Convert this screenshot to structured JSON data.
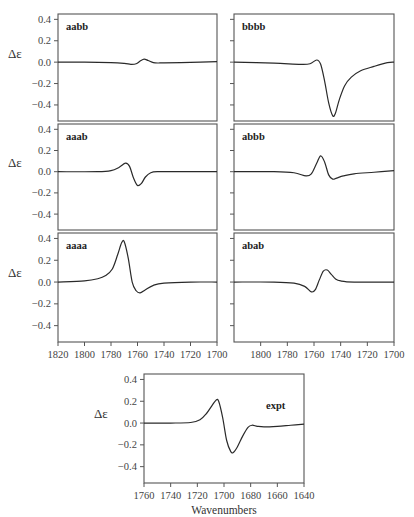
{
  "chart_data": [
    {
      "type": "line",
      "panel": "aabb",
      "title": "aabb",
      "xlabel": "",
      "ylabel": "Δε",
      "xlim": [
        1820,
        1700
      ],
      "ylim": [
        -0.55,
        0.45
      ],
      "yticks": [
        0.4,
        0.2,
        0.0,
        -0.2,
        -0.4
      ],
      "x": [
        1820,
        1800,
        1780,
        1770,
        1765,
        1761,
        1758,
        1755,
        1752,
        1748,
        1744,
        1740,
        1720,
        1700
      ],
      "y": [
        0.0,
        0.0,
        -0.005,
        -0.012,
        -0.02,
        -0.015,
        0.01,
        0.028,
        0.015,
        -0.005,
        -0.008,
        -0.006,
        -0.002,
        0.005
      ]
    },
    {
      "type": "line",
      "panel": "bbbb",
      "title": "bbbb",
      "xlabel": "",
      "ylabel": "",
      "xlim": [
        1820,
        1700
      ],
      "ylim": [
        -0.55,
        0.45
      ],
      "yticks": [
        0.4,
        0.2,
        0.0,
        -0.2,
        -0.4
      ],
      "x": [
        1820,
        1790,
        1770,
        1763,
        1758,
        1755,
        1752,
        1749,
        1746,
        1744,
        1741,
        1737,
        1732,
        1725,
        1715,
        1705,
        1700
      ],
      "y": [
        0.0,
        -0.01,
        -0.02,
        -0.015,
        0.02,
        -0.02,
        -0.18,
        -0.38,
        -0.5,
        -0.48,
        -0.35,
        -0.22,
        -0.14,
        -0.08,
        -0.04,
        -0.005,
        0.0
      ]
    },
    {
      "type": "line",
      "panel": "aaab",
      "title": "aaab",
      "xlabel": "",
      "ylabel": "Δε",
      "xlim": [
        1820,
        1700
      ],
      "ylim": [
        -0.55,
        0.45
      ],
      "yticks": [
        0.4,
        0.2,
        0.0,
        -0.2,
        -0.4
      ],
      "x": [
        1820,
        1790,
        1780,
        1774,
        1769,
        1766,
        1763,
        1760,
        1757,
        1754,
        1750,
        1745,
        1730,
        1700
      ],
      "y": [
        0.0,
        0.0,
        0.01,
        0.04,
        0.08,
        0.05,
        -0.06,
        -0.13,
        -0.11,
        -0.05,
        -0.01,
        0.0,
        0.0,
        0.0
      ]
    },
    {
      "type": "line",
      "panel": "abbb",
      "title": "abbb",
      "xlabel": "",
      "ylabel": "",
      "xlim": [
        1820,
        1700
      ],
      "ylim": [
        -0.55,
        0.45
      ],
      "yticks": [
        0.4,
        0.2,
        0.0,
        -0.2,
        -0.4
      ],
      "x": [
        1820,
        1790,
        1775,
        1766,
        1762,
        1758,
        1755,
        1752,
        1749,
        1746,
        1743,
        1738,
        1730,
        1715,
        1700
      ],
      "y": [
        0.0,
        0.0,
        -0.01,
        -0.04,
        -0.02,
        0.08,
        0.15,
        0.09,
        -0.03,
        -0.07,
        -0.06,
        -0.04,
        -0.02,
        -0.005,
        0.01
      ]
    },
    {
      "type": "line",
      "panel": "aaaa",
      "title": "aaaa",
      "xlabel": "",
      "ylabel": "Δε",
      "xlim": [
        1820,
        1700
      ],
      "ylim": [
        -0.55,
        0.45
      ],
      "yticks": [
        0.4,
        0.2,
        0.0,
        -0.2,
        -0.4
      ],
      "xticks": [
        1820,
        1800,
        1780,
        1760,
        1740,
        1720,
        1700
      ],
      "x": [
        1820,
        1800,
        1790,
        1784,
        1779,
        1775,
        1772,
        1770,
        1767,
        1764,
        1761,
        1758,
        1754,
        1748,
        1740,
        1720,
        1700
      ],
      "y": [
        0.0,
        0.01,
        0.03,
        0.06,
        0.12,
        0.25,
        0.36,
        0.37,
        0.22,
        0.0,
        -0.08,
        -0.1,
        -0.07,
        -0.03,
        -0.01,
        0.0,
        0.0
      ]
    },
    {
      "type": "line",
      "panel": "abab",
      "title": "abab",
      "xlabel": "",
      "ylabel": "",
      "xlim": [
        1820,
        1700
      ],
      "ylim": [
        -0.55,
        0.45
      ],
      "yticks": [
        0.4,
        0.2,
        0.0,
        -0.2,
        -0.4
      ],
      "xticks": [
        1800,
        1780,
        1760,
        1740,
        1720,
        1700
      ],
      "x": [
        1820,
        1790,
        1775,
        1767,
        1762,
        1759,
        1756,
        1753,
        1750,
        1747,
        1744,
        1740,
        1730,
        1700
      ],
      "y": [
        0.0,
        0.0,
        -0.01,
        -0.04,
        -0.09,
        -0.07,
        0.02,
        0.1,
        0.11,
        0.07,
        0.03,
        0.01,
        0.0,
        0.0
      ]
    },
    {
      "type": "line",
      "panel": "expt",
      "title": "expt",
      "xlabel": "Wavenumbers",
      "ylabel": "Δε",
      "xlim": [
        1760,
        1640
      ],
      "ylim": [
        -0.55,
        0.45
      ],
      "yticks": [
        0.4,
        0.2,
        0.0,
        -0.2,
        -0.4
      ],
      "xticks": [
        1760,
        1740,
        1720,
        1700,
        1680,
        1660,
        1640
      ],
      "x": [
        1760,
        1740,
        1725,
        1718,
        1713,
        1709,
        1706,
        1704,
        1701,
        1698,
        1695,
        1693,
        1690,
        1686,
        1682,
        1679,
        1675,
        1670,
        1660,
        1650,
        1640
      ],
      "y": [
        0.0,
        0.0,
        0.005,
        0.03,
        0.09,
        0.16,
        0.21,
        0.2,
        0.05,
        -0.16,
        -0.26,
        -0.27,
        -0.22,
        -0.12,
        -0.04,
        -0.02,
        -0.03,
        -0.035,
        -0.03,
        -0.02,
        -0.01
      ]
    }
  ],
  "labels": {
    "ylabel": "Δε",
    "xlabel": "Wavenumbers",
    "panels": [
      "aabb",
      "bbbb",
      "aaab",
      "abbb",
      "aaaa",
      "abab",
      "expt"
    ]
  }
}
